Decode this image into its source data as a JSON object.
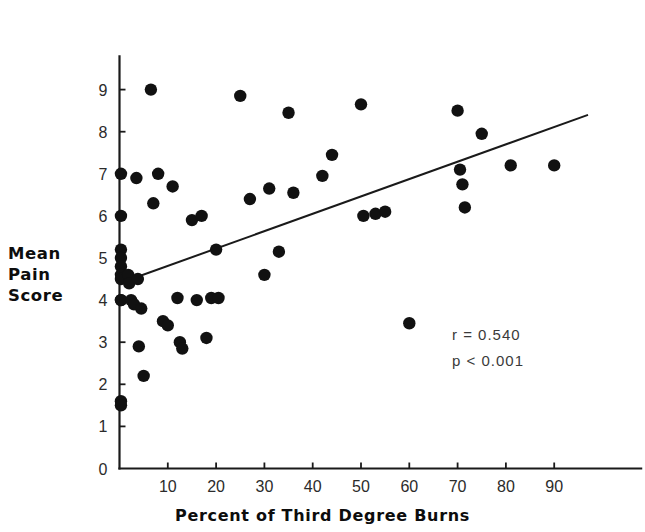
{
  "figure": {
    "y_axis_label_lines": [
      "Mean",
      "Pain",
      "Score"
    ],
    "x_axis_title": "Percent of Third Degree Burns",
    "stats": {
      "r_text": "r = 0.540",
      "p_text": "p < 0.001"
    },
    "colors": {
      "marker": "#111111",
      "axis": "#1a1a1a",
      "regression_line": "#1a1a1a",
      "background": "#ffffff",
      "tick_text": "#2b2b2b"
    }
  },
  "chart_data": {
    "type": "scatter",
    "title": "",
    "xlabel": "Percent of Third Degree Burns",
    "ylabel": "Mean Pain Score",
    "xlim": [
      0,
      100
    ],
    "ylim": [
      0,
      9.6
    ],
    "xticks": [
      10,
      20,
      30,
      40,
      50,
      60,
      70,
      80,
      90
    ],
    "yticks": [
      0,
      1,
      2,
      3,
      4,
      5,
      6,
      7,
      8,
      9
    ],
    "xtick_labels": [
      "10",
      "20",
      "30",
      "40",
      "50",
      "60",
      "70",
      "80",
      "90"
    ],
    "ytick_labels": [
      "0",
      "1",
      "2",
      "3",
      "4",
      "5",
      "6",
      "7",
      "8",
      "9"
    ],
    "grid": false,
    "legend": null,
    "annotations": [
      {
        "text": "r = 0.540",
        "x": 70,
        "y": 3.4
      },
      {
        "text": "p < 0.001",
        "x": 70,
        "y": 2.8
      }
    ],
    "correlation_r": 0.54,
    "p_value_text": "< 0.001",
    "n_points": 57,
    "x": [
      0.3,
      0.3,
      0.3,
      0.3,
      0.3,
      0.3,
      0.3,
      0.3,
      0.3,
      0.3,
      0.3,
      1.8,
      2.0,
      2.4,
      3.0,
      3.5,
      3.8,
      4.0,
      4.5,
      5.0,
      6.5,
      7.0,
      8.0,
      9.0,
      10.0,
      11.0,
      12.0,
      12.5,
      13.0,
      15.0,
      16.0,
      17.0,
      18.0,
      19.0,
      20.0,
      20.5,
      25.0,
      27.0,
      30.0,
      31.0,
      33.0,
      35.0,
      36.0,
      42.0,
      44.0,
      50.0,
      50.5,
      53.0,
      55.0,
      60.0,
      70.0,
      70.5,
      71.0,
      71.5,
      75.0,
      81.0,
      90.0
    ],
    "y": [
      7.0,
      6.0,
      5.2,
      5.0,
      4.8,
      4.6,
      4.5,
      4.0,
      4.0,
      1.6,
      1.5,
      4.6,
      4.4,
      4.0,
      3.9,
      6.9,
      4.5,
      2.9,
      3.8,
      2.2,
      9.0,
      6.3,
      7.0,
      3.5,
      3.4,
      6.7,
      4.05,
      3.0,
      2.85,
      5.9,
      4.0,
      6.0,
      3.1,
      4.05,
      5.2,
      4.05,
      8.85,
      6.4,
      4.6,
      6.65,
      5.15,
      8.45,
      6.55,
      6.95,
      7.45,
      8.65,
      6.0,
      6.05,
      6.1,
      3.45,
      8.5,
      7.1,
      6.75,
      6.2,
      7.95,
      7.2,
      7.2
    ],
    "regression_line": {
      "x_start": 0.0,
      "y_start": 4.4,
      "x_end": 97.0,
      "y_end": 8.4,
      "label": "least-squares fit"
    }
  }
}
